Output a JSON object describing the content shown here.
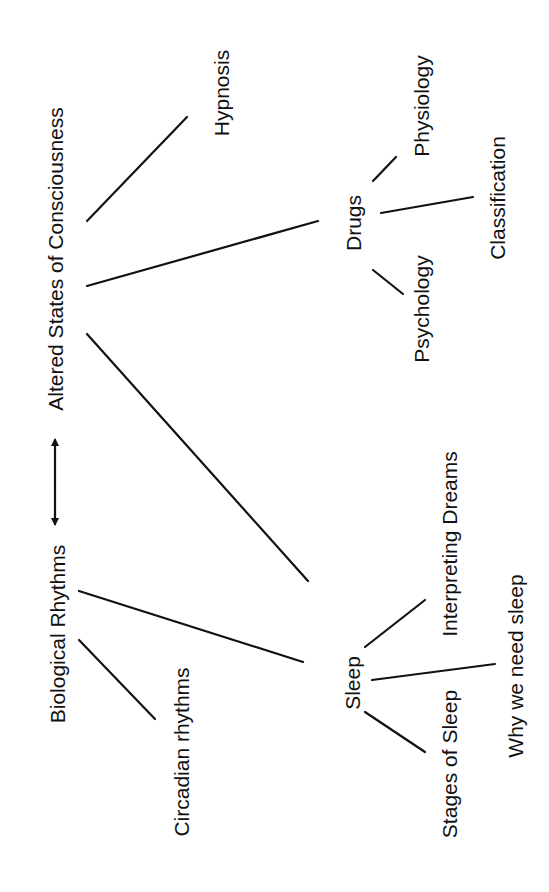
{
  "diagram": {
    "type": "concept-map",
    "orientation": "rotated-90-ccw",
    "colors": {
      "background": "#ffffff",
      "ink": "#111111"
    },
    "nodes": {
      "altered_states": {
        "label": "Altered States of Consciousness"
      },
      "hypnosis": {
        "label": "Hypnosis"
      },
      "drugs": {
        "label": "Drugs"
      },
      "physiology": {
        "label": "Physiology"
      },
      "classification": {
        "label": "Classification"
      },
      "psychology": {
        "label": "Psychology"
      },
      "biological_rhythms": {
        "label": "Biological Rhythms"
      },
      "circadian_rhythms": {
        "label": "Circadian rhythms"
      },
      "sleep": {
        "label": "Sleep"
      },
      "interpreting_dreams": {
        "label": "Interpreting Dreams"
      },
      "why_we_need_sleep": {
        "label": "Why we need sleep"
      },
      "stages_of_sleep": {
        "label": "Stages of Sleep"
      }
    },
    "edges": [
      {
        "from": "Altered States of Consciousness",
        "to": "Hypnosis"
      },
      {
        "from": "Altered States of Consciousness",
        "to": "Drugs"
      },
      {
        "from": "Altered States of Consciousness",
        "to": "Sleep"
      },
      {
        "from": "Drugs",
        "to": "Physiology"
      },
      {
        "from": "Drugs",
        "to": "Classification"
      },
      {
        "from": "Drugs",
        "to": "Psychology"
      },
      {
        "from": "Biological Rhythms",
        "to": "Sleep"
      },
      {
        "from": "Biological Rhythms",
        "to": "Circadian rhythms"
      },
      {
        "from": "Sleep",
        "to": "Interpreting Dreams"
      },
      {
        "from": "Sleep",
        "to": "Why we need sleep"
      },
      {
        "from": "Sleep",
        "to": "Stages of Sleep"
      },
      {
        "from": "Biological Rhythms",
        "to": "Altered States of Consciousness",
        "style": "double-arrow"
      }
    ]
  }
}
